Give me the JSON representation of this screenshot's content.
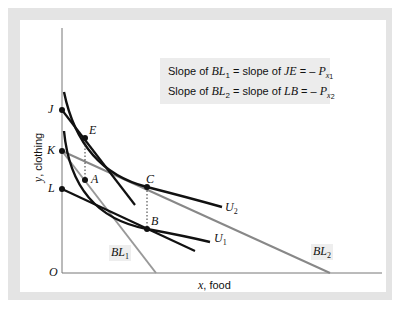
{
  "figure": {
    "legend": {
      "line1": {
        "prefix": "Slope of ",
        "bl": "BL",
        "bl_sub": "1",
        "mid": " = slope of ",
        "seg": "JE",
        "eq": " = – ",
        "p": "P",
        "p_sub": "x",
        "p_subsub": "1"
      },
      "line2": {
        "prefix": "Slope of ",
        "bl": "BL",
        "bl_sub": "2",
        "mid": " = slope of ",
        "seg": "LB",
        "eq": " = – ",
        "p": "P",
        "p_sub": "x",
        "p_subsub": "2"
      }
    },
    "axes": {
      "y_label_var": "y",
      "y_label_text": ", clothing",
      "x_label_var": "x",
      "x_label_text": ", food",
      "origin": "O"
    },
    "points": {
      "J": "J",
      "K": "K",
      "L": "L",
      "E": "E",
      "A": "A",
      "C": "C",
      "B": "B"
    },
    "curves": {
      "U1": {
        "name": "U",
        "sub": "1"
      },
      "U2": {
        "name": "U",
        "sub": "2"
      },
      "BL1": {
        "name": "BL",
        "sub": "1"
      },
      "BL2": {
        "name": "BL",
        "sub": "2"
      }
    },
    "colors": {
      "frame": "#e4e4e4",
      "line_dark": "#111111",
      "line_gray": "#888888",
      "legend_bg": "#ececec"
    }
  }
}
